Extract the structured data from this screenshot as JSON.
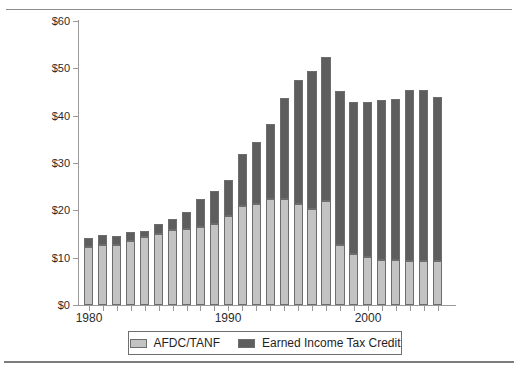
{
  "chart_data": {
    "type": "bar",
    "subtype": "stacked-bar",
    "title": "",
    "xlabel": "",
    "ylabel": "",
    "ylim": [
      0,
      60
    ],
    "y_tick_values": [
      0,
      10,
      20,
      30,
      40,
      50,
      60
    ],
    "y_tick_labels": [
      "$0",
      "$10",
      "$20",
      "$30",
      "$40",
      "$50",
      "$60"
    ],
    "y_unit": "billions of dollars",
    "grid": false,
    "legend_position": "bottom",
    "x": [
      1980,
      1981,
      1982,
      1983,
      1984,
      1985,
      1986,
      1987,
      1988,
      1989,
      1990,
      1991,
      1992,
      1993,
      1994,
      1995,
      1996,
      1997,
      1998,
      1999,
      2000,
      2001,
      2002,
      2003,
      2004,
      2005
    ],
    "categories": [
      "1980",
      "1981",
      "1982",
      "1983",
      "1984",
      "1985",
      "1986",
      "1987",
      "1988",
      "1989",
      "1990",
      "1991",
      "1992",
      "1993",
      "1994",
      "1995",
      "1996",
      "1997",
      "1998",
      "1999",
      "2000",
      "2001",
      "2002",
      "2003",
      "2004",
      "2005"
    ],
    "x_tick_labels_shown": [
      "1980",
      "1990",
      "2000"
    ],
    "x_tick_label_positions": [
      1980,
      1990,
      2000
    ],
    "series": [
      {
        "name": "AFDC/TANF",
        "color": "#c3c3c3",
        "values": [
          12.2,
          12.7,
          12.6,
          13.6,
          14.3,
          15.0,
          15.8,
          16.1,
          16.5,
          17.2,
          18.9,
          20.9,
          21.4,
          22.5,
          22.4,
          21.3,
          20.3,
          21.9,
          12.6,
          10.7,
          10.1,
          9.6,
          9.5,
          9.3,
          9.3,
          9.3
        ]
      },
      {
        "name": "Earned Income Tax Credit",
        "color": "#5e5e5e",
        "values": [
          1.9,
          2.0,
          1.9,
          1.9,
          1.4,
          2.1,
          2.3,
          3.6,
          6.0,
          6.9,
          7.6,
          11.0,
          13.1,
          15.7,
          21.3,
          26.3,
          29.2,
          30.4,
          32.7,
          32.1,
          32.7,
          33.7,
          34.0,
          36.2,
          36.2,
          34.6
        ]
      }
    ],
    "totals": [
      14.1,
      14.7,
      14.5,
      15.5,
      15.7,
      17.1,
      18.1,
      19.7,
      22.5,
      24.1,
      26.5,
      31.9,
      34.5,
      38.2,
      43.7,
      47.6,
      49.5,
      52.3,
      45.3,
      42.8,
      42.8,
      43.3,
      43.5,
      45.5,
      45.5,
      43.9
    ]
  },
  "legend": {
    "entries": [
      {
        "label": "AFDC/TANF",
        "color": "#c3c3c3"
      },
      {
        "label": "Earned Income Tax Credit",
        "color": "#5e5e5e"
      }
    ]
  },
  "axes": {
    "y_labels": [
      "$60",
      "$50",
      "$40",
      "$30",
      "$20",
      "$10",
      "$0"
    ],
    "x_labels": [
      "1980",
      "1990",
      "2000"
    ]
  },
  "colors": {
    "afdc": "#c3c3c3",
    "eitc": "#5e5e5e",
    "bar_outline": "#6d6d6d",
    "axis": "#9a9a9a",
    "text": "#2b2b2b",
    "rule": "#8d8d8d",
    "background": "#ffffff"
  }
}
